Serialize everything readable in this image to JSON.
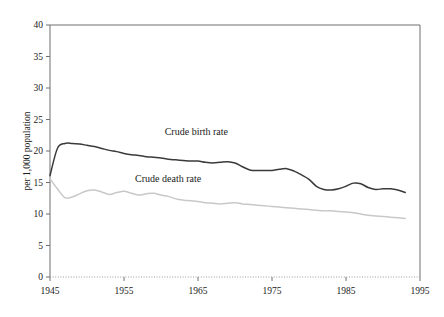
{
  "chart_data": {
    "type": "line",
    "title": "",
    "xlabel": "",
    "ylabel": "per 1,000 population",
    "xlim": [
      1945,
      1995
    ],
    "ylim": [
      0,
      40
    ],
    "xticks": [
      1945,
      1955,
      1965,
      1975,
      1985,
      1995
    ],
    "xtick_labels": [
      "1945",
      "1955",
      "1965",
      "1975",
      "1985",
      "1995"
    ],
    "yticks": [
      0,
      5,
      10,
      15,
      20,
      25,
      30,
      35,
      40
    ],
    "ytick_labels": [
      "0",
      "5",
      "10",
      "15",
      "20",
      "25",
      "30",
      "35",
      "40"
    ],
    "grid": false,
    "baseline_style": "dotted",
    "legend_position": "inline-annotation",
    "x": [
      1945,
      1946,
      1947,
      1948,
      1949,
      1950,
      1951,
      1952,
      1953,
      1954,
      1955,
      1956,
      1957,
      1958,
      1959,
      1960,
      1961,
      1962,
      1963,
      1964,
      1965,
      1966,
      1967,
      1968,
      1969,
      1970,
      1971,
      1972,
      1973,
      1974,
      1975,
      1976,
      1977,
      1978,
      1979,
      1980,
      1981,
      1982,
      1983,
      1984,
      1985,
      1986,
      1987,
      1988,
      1989,
      1990,
      1991,
      1992,
      1993
    ],
    "series": [
      {
        "name": "Crude birth rate",
        "color": "#3a3a3a",
        "width": 1.5,
        "label_x": 1960.5,
        "label_y": 22.6,
        "values": [
          16.1,
          20.4,
          21.2,
          21.2,
          21.1,
          20.9,
          20.7,
          20.4,
          20.1,
          19.9,
          19.6,
          19.4,
          19.3,
          19.1,
          19.0,
          18.9,
          18.7,
          18.6,
          18.5,
          18.4,
          18.4,
          18.2,
          18.1,
          18.2,
          18.3,
          18.1,
          17.5,
          17.0,
          16.9,
          16.9,
          16.9,
          17.1,
          17.2,
          16.8,
          16.2,
          15.5,
          14.4,
          13.9,
          13.8,
          14.0,
          14.4,
          14.9,
          14.8,
          14.2,
          13.9,
          14.0,
          14.0,
          13.8,
          13.4
        ]
      },
      {
        "name": "Crude death rate",
        "color": "#c8c8c8",
        "width": 1.5,
        "label_x": 1956.5,
        "label_y": 15.1,
        "values": [
          15.6,
          14.0,
          12.6,
          12.7,
          13.2,
          13.7,
          13.8,
          13.5,
          13.1,
          13.4,
          13.6,
          13.3,
          13.0,
          13.2,
          13.3,
          13.0,
          12.8,
          12.4,
          12.2,
          12.1,
          12.0,
          11.8,
          11.7,
          11.6,
          11.7,
          11.8,
          11.6,
          11.5,
          11.4,
          11.3,
          11.2,
          11.1,
          11.0,
          10.9,
          10.8,
          10.7,
          10.6,
          10.5,
          10.5,
          10.4,
          10.3,
          10.2,
          10.0,
          9.8,
          9.7,
          9.6,
          9.5,
          9.4,
          9.3
        ]
      }
    ]
  },
  "plot": {
    "left": 50,
    "right": 420,
    "top": 25,
    "bottom": 277,
    "data_end_year": 1993
  },
  "colors": {
    "axis": "#6e6e6e",
    "text": "#1a1a1a",
    "birth_rate": "#3a3a3a",
    "death_rate": "#c8c8c8",
    "background": "#ffffff"
  }
}
